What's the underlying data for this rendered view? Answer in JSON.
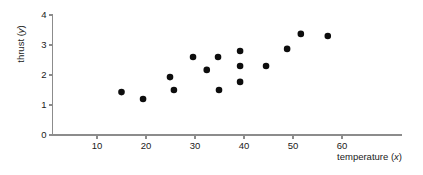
{
  "chart_data": {
    "type": "scatter",
    "title": "",
    "xlabel": "temperature (x)",
    "ylabel": "thrust (y)",
    "xlabel_plain": "temperature",
    "xlabel_var": "x",
    "ylabel_plain": "thrust",
    "ylabel_var": "y",
    "xlim": [
      0,
      68
    ],
    "ylim": [
      0,
      4
    ],
    "xticks": [
      10,
      20,
      30,
      40,
      50,
      60
    ],
    "yticks": [
      0,
      1,
      2,
      3,
      4
    ],
    "xtick_labels": [
      "10",
      "20",
      "30",
      "40",
      "50",
      "60"
    ],
    "ytick_labels": [
      "0",
      "1",
      "2",
      "3",
      "4"
    ],
    "grid": false,
    "legend": false,
    "marker": "filled-circle",
    "marker_color": "#0d0d0d",
    "axis_color": "#8c8c8c",
    "background": "#ffffff",
    "n_points": 15,
    "points": [
      {
        "x": 15.0,
        "y": 1.43
      },
      {
        "x": 19.4,
        "y": 1.2
      },
      {
        "x": 24.9,
        "y": 1.93
      },
      {
        "x": 25.7,
        "y": 1.5
      },
      {
        "x": 29.6,
        "y": 2.6
      },
      {
        "x": 32.4,
        "y": 2.17
      },
      {
        "x": 34.7,
        "y": 2.6
      },
      {
        "x": 34.9,
        "y": 1.5
      },
      {
        "x": 39.2,
        "y": 2.8
      },
      {
        "x": 39.2,
        "y": 2.3
      },
      {
        "x": 39.2,
        "y": 1.77
      },
      {
        "x": 44.5,
        "y": 2.3
      },
      {
        "x": 48.8,
        "y": 2.87
      },
      {
        "x": 51.6,
        "y": 3.37
      },
      {
        "x": 57.1,
        "y": 3.3
      }
    ],
    "x": [
      15.0,
      19.4,
      24.9,
      25.7,
      29.6,
      32.4,
      34.7,
      34.9,
      39.2,
      39.2,
      39.2,
      44.5,
      48.8,
      51.6,
      57.1
    ],
    "values": [
      1.43,
      1.2,
      1.93,
      1.5,
      2.6,
      2.17,
      2.6,
      1.5,
      2.8,
      2.3,
      1.77,
      2.3,
      2.87,
      3.37,
      3.3
    ]
  }
}
